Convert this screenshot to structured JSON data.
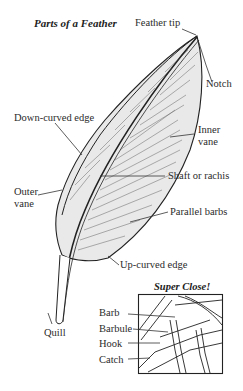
{
  "title": "Parts of a Feather",
  "labels": {
    "feather_tip": "Feather tip",
    "notch": "Notch",
    "down_curved_edge": "Down-curved edge",
    "inner_vane_1": "Inner",
    "inner_vane_2": "vane",
    "shaft": "Shaft or rachis",
    "outer_vane_1": "Outer",
    "outer_vane_2": "vane",
    "parallel_barbs": "Parallel barbs",
    "up_curved_edge": "Up-curved edge",
    "quill": "Quill"
  },
  "inset": {
    "title": "Super Close!",
    "labels": [
      "Barb",
      "Barbule",
      "Hook",
      "Catch"
    ]
  }
}
